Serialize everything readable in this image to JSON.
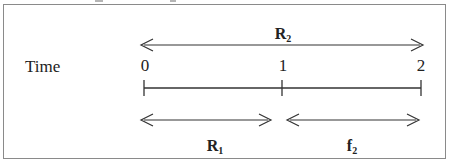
{
  "diagram": {
    "type": "timeline",
    "axis_label": "Time",
    "ticks": [
      {
        "label": "0",
        "x": 144
      },
      {
        "label": "1",
        "x": 282
      },
      {
        "label": "2",
        "x": 421
      }
    ],
    "spans": [
      {
        "name": "R",
        "subscript": "2",
        "from": "0",
        "to": "2",
        "position": "above"
      },
      {
        "name": "R",
        "subscript": "1",
        "from": "0",
        "to": "1",
        "position": "below"
      },
      {
        "name": "f",
        "subscript": "2",
        "from": "1",
        "to": "2",
        "position": "below"
      }
    ],
    "colors": {
      "line": "#333333",
      "frame": "#8a8a8a",
      "text": "#222222"
    }
  }
}
